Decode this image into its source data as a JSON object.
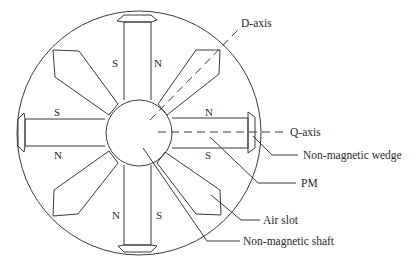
{
  "diagram": {
    "type": "cross-section",
    "axes": {
      "d_axis_label": "D-axis",
      "q_axis_label": "Q-axis"
    },
    "poles": {
      "top_magnet": {
        "left": "S",
        "right": "N"
      },
      "left_magnet": {
        "top": "S",
        "bottom": "N"
      },
      "right_magnet": {
        "top": "N",
        "bottom": "S"
      },
      "bottom_magnet": {
        "left": "N",
        "right": "S"
      }
    },
    "callouts": [
      {
        "label": "Non-magnetic wedge"
      },
      {
        "label": "PM"
      },
      {
        "label": "Air slot"
      },
      {
        "label": "Non-magnetic shaft"
      }
    ],
    "colors": {
      "line": "#3a3a3a",
      "text": "#2a2a2a",
      "background": "#ffffff"
    }
  }
}
